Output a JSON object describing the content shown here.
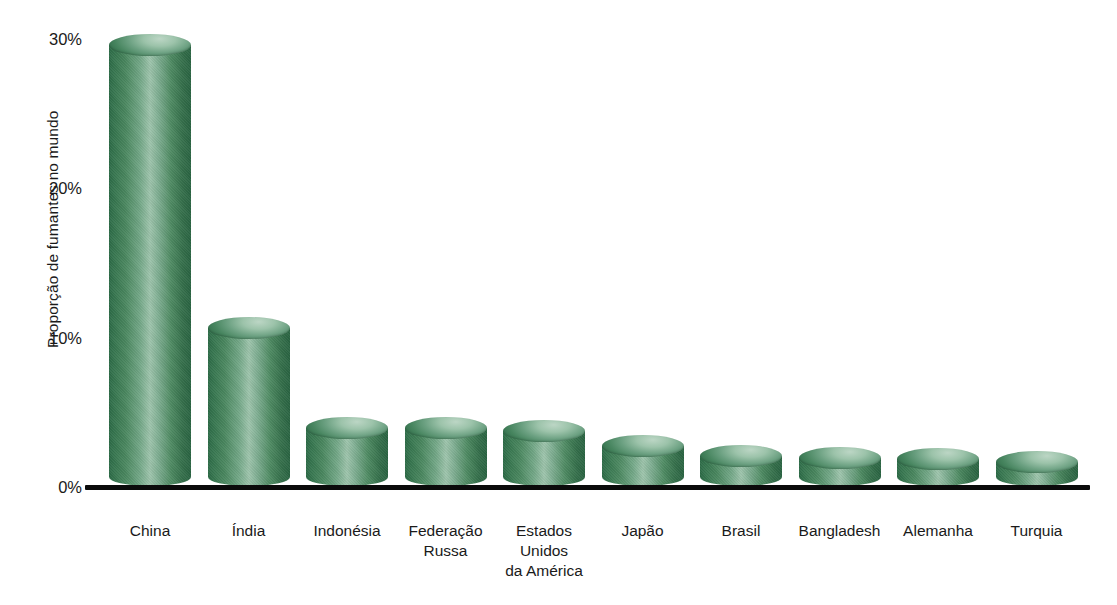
{
  "chart_data": {
    "type": "bar",
    "title": "",
    "subtitle": "",
    "xlabel": "",
    "ylabel": "Proporção de fumantes no mundo",
    "ylim": [
      0,
      30
    ],
    "yunit": "%",
    "grid": false,
    "legend": null,
    "categories": [
      "China",
      "Índia",
      "Indonésia",
      "Federação\nRussa",
      "Estados\nUnidos\nda América",
      "Japão",
      "Brasil",
      "Bangladesh",
      "Alemanha",
      "Turquia"
    ],
    "values": [
      29.5,
      10.6,
      3.9,
      3.9,
      3.7,
      2.7,
      2.0,
      1.9,
      1.8,
      1.6
    ],
    "y_ticks": [
      "0%",
      "10%",
      "20%",
      "30%"
    ],
    "y_tick_values": [
      0,
      10,
      20,
      30
    ],
    "series": [
      {
        "name": "Proporção de fumantes no mundo",
        "values": [
          29.5,
          10.6,
          3.9,
          3.9,
          3.7,
          2.7,
          2.0,
          1.9,
          1.8,
          1.6
        ]
      }
    ]
  },
  "style": {
    "bar_color": "#4a875f",
    "bar_highlight": "#9ec4ac",
    "bar_shadow": "#2a6442",
    "axis_color": "#0b0b0b",
    "text_color": "#1a1a1a",
    "background": "#ffffff"
  }
}
